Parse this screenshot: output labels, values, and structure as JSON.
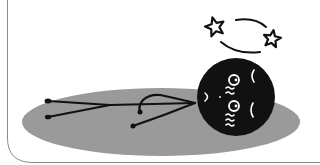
{
  "illustration": {
    "subject": "dizzy stick figure lying on back",
    "description": "Stick figure with a black round head lying on a gray oval shadow, with two stars circling above its head",
    "colors": {
      "background": "#ffffff",
      "shadow": "#9a9a9a",
      "figure": "#111111",
      "face_marks": "#ffffff",
      "border": "#8a8a8a"
    },
    "elements": [
      "border-frame",
      "shadow-ellipse",
      "stick-body",
      "head",
      "dizzy-stars"
    ]
  }
}
